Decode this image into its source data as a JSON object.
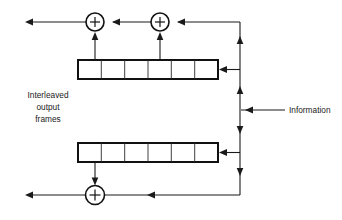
{
  "diagram": {
    "type": "block-diagram",
    "canvas": {
      "width": 342,
      "height": 220
    },
    "colors": {
      "line": "#1a1a1a",
      "register_border": "#111111",
      "background": "#ffffff",
      "text": "#1a1a1a"
    },
    "labels": {
      "output_line1": "Interleaved",
      "output_line2": "output",
      "output_line3": "frames",
      "information": "Information"
    },
    "adders": [
      {
        "id": "adder-top-left",
        "symbol": "+",
        "cx": 95,
        "cy": 22,
        "r": 9
      },
      {
        "id": "adder-top-right",
        "symbol": "+",
        "cx": 160,
        "cy": 22,
        "r": 9
      },
      {
        "id": "adder-bottom",
        "symbol": "+",
        "cx": 95,
        "cy": 195,
        "r": 9.5
      }
    ],
    "registers": [
      {
        "id": "shift-register-top",
        "cells": 6,
        "x": 78,
        "y": 60,
        "width": 140,
        "height": 19,
        "cell_labels": [
          "",
          "",
          "",
          "",
          "",
          ""
        ]
      },
      {
        "id": "shift-register-bottom",
        "cells": 6,
        "x": 78,
        "y": 143,
        "width": 140,
        "height": 19,
        "cell_labels": [
          "",
          "",
          "",
          "",
          "",
          ""
        ]
      }
    ],
    "bus": {
      "id": "information-bus",
      "x": 240,
      "top_y": 22,
      "bottom_y": 195,
      "input_y": 110
    }
  }
}
